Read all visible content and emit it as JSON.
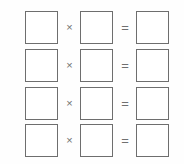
{
  "worksheet": {
    "title": "Multiplication equation worksheet grid",
    "background_color": "#fefefe",
    "box_border_color": "#6e6e6e",
    "operator_color": "#707070",
    "row_count": 4,
    "column_count": 3,
    "operators": {
      "multiply": "×",
      "equals": "="
    },
    "rows": [
      {
        "index": "1",
        "factor_a": "",
        "multiply_symbol": "×",
        "factor_b": "",
        "equals_symbol": "=",
        "product": ""
      },
      {
        "index": "2",
        "factor_a": "",
        "multiply_symbol": "×",
        "factor_b": "",
        "equals_symbol": "=",
        "product": ""
      },
      {
        "index": "3",
        "factor_a": "",
        "multiply_symbol": "×",
        "factor_b": "",
        "equals_symbol": "=",
        "product": ""
      },
      {
        "index": "4",
        "factor_a": "",
        "multiply_symbol": "×",
        "factor_b": "",
        "equals_symbol": "=",
        "product": ""
      }
    ]
  }
}
